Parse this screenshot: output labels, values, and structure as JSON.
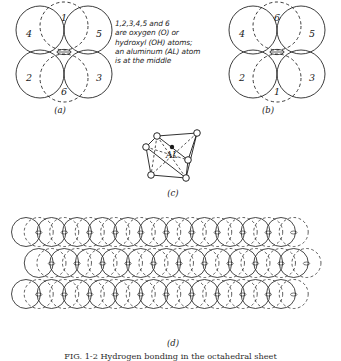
{
  "figure": {
    "title_caption": "FIG. 1-2  Hydrogen bonding in the octahedral sheet",
    "note_lines": [
      "1,2,3,4,5 and 6",
      "are oxygen (O) or",
      "hydroxyl (OH) atoms;",
      "an aluminum (AL) atom",
      "is at the middle"
    ],
    "panel_labels": {
      "a": "(a)",
      "b": "(b)",
      "c": "(c)",
      "d": "(d)"
    }
  },
  "panel_a": {
    "name": "octahedral-unit-view-a",
    "atom_labels": [
      "1",
      "4",
      "5",
      "2",
      "3",
      "6"
    ],
    "atoms": [
      {
        "id": "1",
        "cx": 64,
        "cy": 26,
        "r": 24,
        "style": "dashed",
        "label_dx": 0,
        "label_dy": -8
      },
      {
        "id": "4",
        "cx": 40,
        "cy": 30,
        "r": 24,
        "style": "solid",
        "label_dx": -11,
        "label_dy": 4
      },
      {
        "id": "5",
        "cx": 88,
        "cy": 30,
        "r": 24,
        "style": "solid",
        "label_dx": 11,
        "label_dy": 4
      },
      {
        "id": "2",
        "cx": 40,
        "cy": 74,
        "r": 24,
        "style": "solid",
        "label_dx": -11,
        "label_dy": 4
      },
      {
        "id": "3",
        "cx": 88,
        "cy": 74,
        "r": 24,
        "style": "solid",
        "label_dx": 11,
        "label_dy": 4
      },
      {
        "id": "6",
        "cx": 64,
        "cy": 78,
        "r": 24,
        "style": "dashed",
        "label_dx": 0,
        "label_dy": 14
      }
    ],
    "center_atom": {
      "cx": 64,
      "cy": 52
    }
  },
  "panel_b": {
    "name": "octahedral-unit-view-b",
    "atom_labels": [
      "6",
      "4",
      "5",
      "2",
      "3",
      "1"
    ],
    "atoms": [
      {
        "id": "6",
        "cx": 277,
        "cy": 26,
        "r": 24,
        "style": "dashed",
        "label_dx": 0,
        "label_dy": -8
      },
      {
        "id": "4",
        "cx": 253,
        "cy": 30,
        "r": 24,
        "style": "solid",
        "label_dx": -11,
        "label_dy": 4
      },
      {
        "id": "5",
        "cx": 301,
        "cy": 30,
        "r": 24,
        "style": "solid",
        "label_dx": 11,
        "label_dy": 4
      },
      {
        "id": "2",
        "cx": 253,
        "cy": 74,
        "r": 24,
        "style": "solid",
        "label_dx": -11,
        "label_dy": 4
      },
      {
        "id": "3",
        "cx": 301,
        "cy": 74,
        "r": 24,
        "style": "solid",
        "label_dx": 11,
        "label_dy": 4
      },
      {
        "id": "1",
        "cx": 277,
        "cy": 78,
        "r": 24,
        "style": "dashed",
        "label_dx": 0,
        "label_dy": 14
      }
    ],
    "center_atom": {
      "cx": 277,
      "cy": 52
    }
  },
  "panel_c": {
    "name": "octahedron-skeleton",
    "center_label": "AL",
    "vertices": [
      {
        "x": 157,
        "y": 136
      },
      {
        "x": 197,
        "y": 133
      },
      {
        "x": 146,
        "y": 147
      },
      {
        "x": 188,
        "y": 160
      },
      {
        "x": 151,
        "y": 175
      },
      {
        "x": 186,
        "y": 178
      }
    ],
    "center": {
      "x": 172,
      "y": 152
    }
  },
  "panel_d": {
    "name": "octahedral-sheet",
    "rows": 3,
    "columns": 11,
    "spacing_x": 25.5,
    "spacing_y": 31,
    "radius": 14.5,
    "origin_x": 26,
    "origin_y": 232,
    "dashed_offset_x": 12.7
  },
  "colors": {
    "ink": "#1a1a1a",
    "ink_soft": "#2b2b2b",
    "paper": "#ffffff"
  }
}
